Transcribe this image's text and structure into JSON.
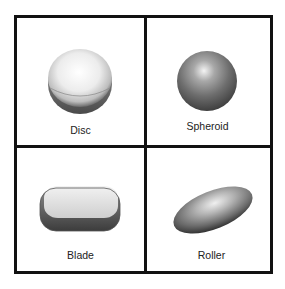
{
  "figure": {
    "cells": [
      {
        "label": "Disc",
        "shape": "disc"
      },
      {
        "label": "Spheroid",
        "shape": "spheroid"
      },
      {
        "label": "Blade",
        "shape": "blade"
      },
      {
        "label": "Roller",
        "shape": "roller"
      }
    ],
    "colors": {
      "border": "#111111",
      "background": "#ffffff"
    }
  }
}
